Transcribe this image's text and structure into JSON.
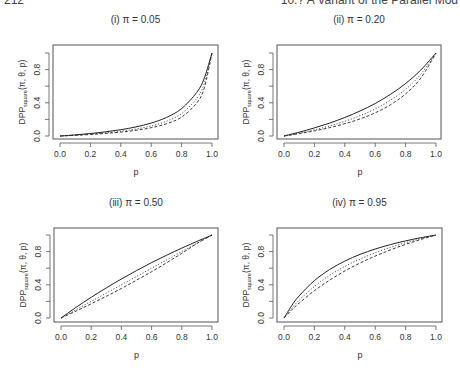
{
  "page_header": {
    "page_number": "212",
    "running_title": "10.? A Variant of the Parallel Mod"
  },
  "chart_data": [
    {
      "type": "line",
      "title": "(i) π = 0.05",
      "pi": 0.05,
      "xlabel": "p",
      "ylabel": "DPP_square(π, θ, p)",
      "xlim": [
        0,
        1
      ],
      "ylim": [
        0,
        1
      ],
      "xticks": [
        "0.0",
        "0.2",
        "0.4",
        "0.6",
        "0.8",
        "1.0"
      ],
      "yticks": [
        "0.0",
        "0.4",
        "0.8"
      ],
      "grid": false,
      "legend": "none",
      "x": [
        0.0,
        0.1,
        0.2,
        0.3,
        0.4,
        0.5,
        0.6,
        0.7,
        0.8,
        0.9,
        0.95,
        1.0
      ],
      "series": [
        {
          "name": "solid",
          "style": "solid",
          "values": [
            0.0,
            0.013,
            0.03,
            0.05,
            0.076,
            0.11,
            0.156,
            0.223,
            0.33,
            0.526,
            0.7,
            1.0
          ]
        },
        {
          "name": "dotted",
          "style": "dotted",
          "values": [
            0.0,
            0.01,
            0.023,
            0.038,
            0.058,
            0.084,
            0.121,
            0.177,
            0.27,
            0.454,
            0.637,
            1.0
          ]
        },
        {
          "name": "dashed",
          "style": "dashed",
          "values": [
            0.0,
            0.008,
            0.018,
            0.031,
            0.047,
            0.069,
            0.1,
            0.147,
            0.228,
            0.399,
            0.584,
            1.0
          ]
        }
      ]
    },
    {
      "type": "line",
      "title": "(ii) π = 0.20",
      "pi": 0.2,
      "xlabel": "p",
      "ylabel": "DPP_square(π, θ, p)",
      "xlim": [
        0,
        1
      ],
      "ylim": [
        0,
        1
      ],
      "xticks": [
        "0.0",
        "0.2",
        "0.4",
        "0.6",
        "0.8",
        "1.0"
      ],
      "yticks": [
        "0.0",
        "0.4",
        "0.8"
      ],
      "grid": false,
      "legend": "none",
      "x": [
        0.0,
        0.1,
        0.2,
        0.3,
        0.4,
        0.5,
        0.6,
        0.7,
        0.8,
        0.9,
        1.0
      ],
      "series": [
        {
          "name": "solid",
          "style": "solid",
          "values": [
            0.0,
            0.046,
            0.097,
            0.156,
            0.223,
            0.301,
            0.392,
            0.501,
            0.632,
            0.795,
            1.0
          ]
        },
        {
          "name": "dotted",
          "style": "dotted",
          "values": [
            0.0,
            0.035,
            0.075,
            0.121,
            0.177,
            0.244,
            0.326,
            0.43,
            0.563,
            0.744,
            1.0
          ]
        },
        {
          "name": "dashed",
          "style": "dashed",
          "values": [
            0.0,
            0.029,
            0.062,
            0.101,
            0.148,
            0.206,
            0.279,
            0.376,
            0.507,
            0.698,
            1.0
          ]
        }
      ]
    },
    {
      "type": "line",
      "title": "(iii) π = 0.50",
      "pi": 0.5,
      "xlabel": "p",
      "ylabel": "DPP_square(π, θ, p)",
      "xlim": [
        0,
        1
      ],
      "ylim": [
        0,
        1
      ],
      "xticks": [
        "0.0",
        "0.2",
        "0.4",
        "0.6",
        "0.8",
        "1.0"
      ],
      "yticks": [
        "0.0",
        "0.4",
        "0.8"
      ],
      "grid": false,
      "legend": "none",
      "x": [
        0.0,
        0.1,
        0.2,
        0.3,
        0.4,
        0.5,
        0.6,
        0.7,
        0.8,
        0.9,
        1.0
      ],
      "series": [
        {
          "name": "solid",
          "style": "solid",
          "values": [
            0.0,
            0.129,
            0.25,
            0.363,
            0.47,
            0.571,
            0.667,
            0.757,
            0.842,
            0.923,
            1.0
          ]
        },
        {
          "name": "dotted",
          "style": "dotted",
          "values": [
            0.0,
            0.1,
            0.2,
            0.3,
            0.4,
            0.5,
            0.6,
            0.7,
            0.8,
            0.9,
            1.0
          ]
        },
        {
          "name": "dashed",
          "style": "dashed",
          "values": [
            0.0,
            0.084,
            0.171,
            0.262,
            0.356,
            0.455,
            0.558,
            0.666,
            0.78,
            0.897,
            1.0
          ]
        }
      ]
    },
    {
      "type": "line",
      "title": "(iv) π = 0.95",
      "pi": 0.95,
      "xlabel": "p",
      "ylabel": "DPP_square(π, θ, p)",
      "xlim": [
        0,
        1
      ],
      "ylim": [
        0,
        1
      ],
      "xticks": [
        "0.0",
        "0.2",
        "0.4",
        "0.6",
        "0.8",
        "1.0"
      ],
      "yticks": [
        "0.0",
        "0.4",
        "0.8"
      ],
      "grid": false,
      "legend": "none",
      "x": [
        0.0,
        0.05,
        0.1,
        0.2,
        0.3,
        0.4,
        0.5,
        0.6,
        0.7,
        0.8,
        0.9,
        1.0
      ],
      "series": [
        {
          "name": "solid",
          "style": "solid",
          "values": [
            0.0,
            0.147,
            0.267,
            0.45,
            0.584,
            0.686,
            0.766,
            0.831,
            0.884,
            0.929,
            0.967,
            1.0
          ]
        },
        {
          "name": "dotted",
          "style": "dotted",
          "values": [
            0.0,
            0.114,
            0.214,
            0.38,
            0.513,
            0.621,
            0.71,
            0.786,
            0.851,
            0.907,
            0.957,
            1.0
          ]
        },
        {
          "name": "dashed",
          "style": "dashed",
          "values": [
            0.0,
            0.095,
            0.18,
            0.329,
            0.456,
            0.566,
            0.662,
            0.746,
            0.82,
            0.887,
            0.946,
            1.0
          ]
        }
      ]
    }
  ],
  "panels": [
    {
      "title": "(i) π = 0.05"
    },
    {
      "title": "(ii) π = 0.20"
    },
    {
      "title": "(iii) π = 0.50"
    },
    {
      "title": "(iv) π = 0.95"
    }
  ],
  "colors": {
    "line": "#222222",
    "axis": "#555555",
    "text": "#333333",
    "background": "#ffffff"
  }
}
